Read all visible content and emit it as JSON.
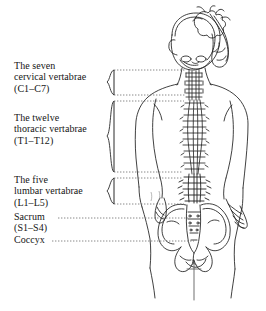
{
  "figure": {
    "view": "posterior",
    "background_color": "#ffffff",
    "ink_color": "#1a1a1a"
  },
  "labels": [
    {
      "id": "cervical",
      "name": "cervical-vertebrae-label",
      "line1": "The seven",
      "line2": "cervical vertabrae",
      "line3": "(C1–C7)",
      "connector": "brace",
      "region_count": 7,
      "range": "C1–C7"
    },
    {
      "id": "thoracic",
      "name": "thoracic-vertebrae-label",
      "line1": "The twelve",
      "line2": "thoracic vertabrae",
      "line3": "(T1–T12)",
      "connector": "brace",
      "region_count": 12,
      "range": "T1–T12"
    },
    {
      "id": "lumbar",
      "name": "lumbar-vertebrae-label",
      "line1": "The five",
      "line2": "lumbar vertabrae",
      "line3": "(L1–L5)",
      "connector": "brace",
      "region_count": 5,
      "range": "L1–L5"
    },
    {
      "id": "sacrum",
      "name": "sacrum-label",
      "line1": "Sacrum",
      "line2": "(S1–S4)",
      "line3": "",
      "connector": "leader-line",
      "region_count": 4,
      "range": "S1–S4"
    },
    {
      "id": "coccyx",
      "name": "coccyx-label",
      "line1": "Coccyx",
      "line2": "",
      "line3": "",
      "connector": "leader-line",
      "region_count": 1,
      "range": "Coccyx"
    }
  ],
  "anatomy": {
    "head": "skull, posterior view",
    "hair": "ponytail tied at crown, sweeping to the right",
    "torso": "back outline with shoulders, waist and hips",
    "arms": "both arms hanging at sides, hands at hip level",
    "spine": "full vertebral column drawn as stacked vertebrae",
    "pelvis": "ilium, sacrum and coccyx",
    "plumb_line": "vertical reference line with cross tick below the pelvis"
  }
}
